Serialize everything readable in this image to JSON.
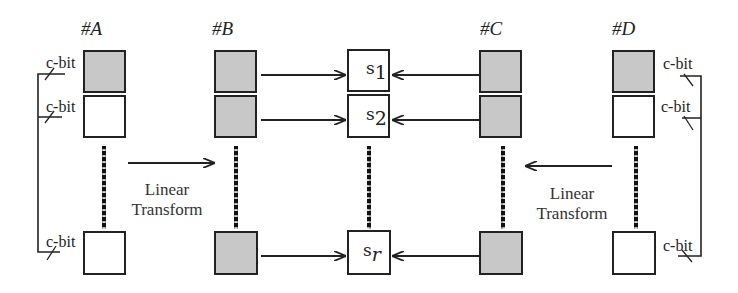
{
  "diagram": {
    "columns": [
      {
        "id": "A",
        "label": "#A",
        "cells": [
          {
            "fill": "shaded"
          },
          {
            "fill": "empty"
          },
          {
            "fill": "empty"
          }
        ],
        "x": 84
      },
      {
        "id": "B",
        "label": "#B",
        "cells": [
          {
            "fill": "shaded"
          },
          {
            "fill": "shaded"
          },
          {
            "fill": "shaded"
          }
        ],
        "x": 215
      },
      {
        "id": "S",
        "label": "",
        "cells": [
          {
            "fill": "empty",
            "text": "s",
            "sub": "1"
          },
          {
            "fill": "empty",
            "text": "s",
            "sub": "2"
          },
          {
            "fill": "empty",
            "text": "s",
            "sub": "r"
          }
        ],
        "x": 348
      },
      {
        "id": "C",
        "label": "#C",
        "cells": [
          {
            "fill": "shaded"
          },
          {
            "fill": "shaded"
          },
          {
            "fill": "shaded"
          }
        ],
        "x": 480
      },
      {
        "id": "D",
        "label": "#D",
        "cells": [
          {
            "fill": "shaded"
          },
          {
            "fill": "empty"
          },
          {
            "fill": "empty"
          }
        ],
        "x": 612
      }
    ],
    "transforms": [
      {
        "line1": "Linear",
        "line2": "Transform",
        "direction": "A-to-B"
      },
      {
        "line1": "Linear",
        "line2": "Transform",
        "direction": "D-to-C"
      }
    ],
    "cbit_label": "c-bit",
    "colors": {
      "shaded": "#c8c8c8",
      "border": "#222222",
      "line": "#222222"
    },
    "arrows": [
      {
        "from": "B1",
        "to": "s1"
      },
      {
        "from": "B2",
        "to": "s2"
      },
      {
        "from": "Br",
        "to": "sr"
      },
      {
        "from": "C1",
        "to": "s1"
      },
      {
        "from": "C2",
        "to": "s2"
      },
      {
        "from": "Cr",
        "to": "sr"
      }
    ]
  }
}
